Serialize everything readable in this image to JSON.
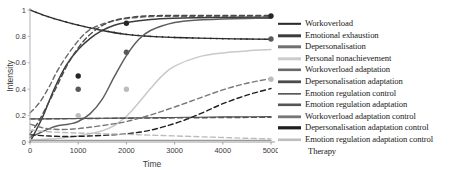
{
  "chart_data": {
    "type": "line",
    "title": "",
    "xlabel": "Time",
    "ylabel": "Intensity",
    "xlim": [
      0,
      5000
    ],
    "ylim": [
      0,
      1
    ],
    "xticks": [
      0,
      1000,
      2000,
      3000,
      4000,
      5000
    ],
    "xticklabels": [
      "0",
      "1000",
      "2000",
      "3000",
      "4000",
      "5000"
    ],
    "yticks": [
      0,
      0.2,
      0.4,
      0.6,
      0.8,
      1
    ],
    "yticklabels": [
      "0",
      "0.2",
      "0.4",
      "0.6",
      "0.8",
      "1"
    ],
    "grid": false,
    "legend_position": "right",
    "series": [
      {
        "name": "Workoverload",
        "color": "#2b2b2b",
        "style": "solid-marked",
        "x": [
          0,
          250,
          500,
          1000,
          1500,
          2000,
          2500,
          3000,
          3500,
          4000,
          4500,
          5000
        ],
        "y": [
          1.0,
          0.965,
          0.935,
          0.885,
          0.845,
          0.815,
          0.8,
          0.792,
          0.787,
          0.783,
          0.78,
          0.778
        ]
      },
      {
        "name": "Emotional exhaustion",
        "color": "#3c3c3c",
        "style": "solid",
        "x": [
          0,
          250,
          500,
          750,
          1000,
          1250,
          1500,
          1750,
          2000,
          2500,
          3000,
          3500,
          4000,
          4500,
          5000
        ],
        "y": [
          0.0,
          0.18,
          0.4,
          0.58,
          0.7,
          0.785,
          0.845,
          0.885,
          0.905,
          0.928,
          0.938,
          0.942,
          0.944,
          0.945,
          0.946
        ]
      },
      {
        "name": "Depersonalisation",
        "color": "#5e5e5e",
        "style": "solid",
        "x": [
          0,
          500,
          800,
          1000,
          1250,
          1500,
          1750,
          2000,
          2250,
          2500,
          3000,
          3500,
          4000,
          4500,
          5000
        ],
        "y": [
          0.035,
          0.115,
          0.135,
          0.155,
          0.215,
          0.325,
          0.495,
          0.655,
          0.775,
          0.845,
          0.905,
          0.925,
          0.932,
          0.936,
          0.938
        ]
      },
      {
        "name": "Personal nonachievement",
        "color": "#c9c9c9",
        "style": "solid",
        "x": [
          0,
          500,
          1000,
          1500,
          1750,
          2000,
          2250,
          2500,
          2750,
          3000,
          3500,
          4000,
          4500,
          5000
        ],
        "y": [
          0.015,
          0.025,
          0.045,
          0.085,
          0.125,
          0.195,
          0.295,
          0.405,
          0.505,
          0.575,
          0.645,
          0.675,
          0.69,
          0.7
        ]
      },
      {
        "name": "Workoverload adaptation",
        "color": "#6a6a6a",
        "style": "dashed",
        "x": [
          0,
          200,
          400,
          600,
          900,
          1200,
          1600,
          2000,
          2500,
          3000,
          3500,
          4000,
          4500,
          5000
        ],
        "y": [
          0.22,
          0.3,
          0.42,
          0.56,
          0.72,
          0.84,
          0.905,
          0.935,
          0.95,
          0.952,
          0.952,
          0.952,
          0.952,
          0.952
        ]
      },
      {
        "name": "Depersonalisation adaptation",
        "color": "#4a4a4a",
        "style": "dashed",
        "x": [
          0,
          200,
          500,
          800,
          1100,
          1400,
          1700,
          2000,
          2400,
          2800,
          3200,
          3600,
          4000,
          4500,
          5000
        ],
        "y": [
          0.06,
          0.17,
          0.38,
          0.6,
          0.76,
          0.86,
          0.915,
          0.94,
          0.955,
          0.958,
          0.958,
          0.958,
          0.958,
          0.958,
          0.958
        ]
      },
      {
        "name": "Emotion regulation control",
        "color": "#4f4f4f",
        "style": "solid-thin",
        "x": [
          0,
          500,
          1000,
          1500,
          2000,
          2500,
          3000,
          3500,
          4000,
          4500,
          5000
        ],
        "y": [
          0.175,
          0.176,
          0.178,
          0.18,
          0.182,
          0.184,
          0.186,
          0.188,
          0.19,
          0.191,
          0.192
        ]
      },
      {
        "name": "Emotion regulation adaptation",
        "color": "#555555",
        "style": "dashed",
        "x": [
          0,
          400,
          800,
          1200,
          1600,
          2000,
          2400,
          2800,
          3200,
          3600,
          4000,
          4400,
          5000
        ],
        "y": [
          0.175,
          0.176,
          0.177,
          0.178,
          0.179,
          0.18,
          0.181,
          0.182,
          0.183,
          0.184,
          0.185,
          0.186,
          0.187
        ]
      },
      {
        "name": "Workoverload adaptation control",
        "color": "#777777",
        "style": "dashed",
        "x": [
          0,
          300,
          600,
          900,
          1200,
          1600,
          2000,
          2500,
          3000,
          3500,
          4000,
          4500,
          5000
        ],
        "y": [
          0.135,
          0.105,
          0.095,
          0.098,
          0.11,
          0.13,
          0.155,
          0.205,
          0.265,
          0.33,
          0.395,
          0.445,
          0.48
        ]
      },
      {
        "name": "Depersonalisation adaptation control",
        "color": "#1f1f1f",
        "style": "dashed",
        "x": [
          0,
          400,
          800,
          1200,
          1600,
          2000,
          2400,
          2800,
          3200,
          3600,
          4000,
          4500,
          5000
        ],
        "y": [
          0.055,
          0.045,
          0.042,
          0.045,
          0.052,
          0.062,
          0.082,
          0.118,
          0.165,
          0.225,
          0.29,
          0.355,
          0.405
        ]
      },
      {
        "name": "Emotion regulation adaptation control",
        "color": "#bdbdbd",
        "style": "dashed",
        "x": [
          0,
          500,
          1000,
          1500,
          2000,
          2500,
          3000,
          3500,
          4000,
          4500,
          5000
        ],
        "y": [
          0.09,
          0.075,
          0.068,
          0.063,
          0.058,
          0.052,
          0.046,
          0.04,
          0.034,
          0.028,
          0.024
        ]
      },
      {
        "name": "Therapy",
        "color": "#9a9a9a",
        "style": "solid-flat",
        "x": [
          0,
          1000,
          2000,
          3000,
          4000,
          5000
        ],
        "y": [
          0.012,
          0.012,
          0.012,
          0.012,
          0.012,
          0.012
        ]
      }
    ],
    "markers": [
      {
        "series": "Emotional exhaustion",
        "color": "#262626",
        "points": [
          [
            1000,
            0.5
          ],
          [
            2000,
            0.9
          ],
          [
            5000,
            0.955
          ]
        ]
      },
      {
        "series": "Depersonalisation",
        "color": "#5a5a5a",
        "points": [
          [
            1000,
            0.4
          ],
          [
            2000,
            0.68
          ],
          [
            5000,
            0.78
          ]
        ]
      },
      {
        "series": "Personal nonachievement",
        "color": "#bcbcbc",
        "points": [
          [
            1000,
            0.2
          ],
          [
            2000,
            0.4
          ],
          [
            5000,
            0.475
          ]
        ]
      }
    ]
  },
  "legend": {
    "items": [
      {
        "label": "Workoverload",
        "style": "solid-marked",
        "color": "#2b2b2b",
        "width": 2.0
      },
      {
        "label": "Emotional exhaustion",
        "style": "solid",
        "color": "#3c3c3c",
        "width": 3.0
      },
      {
        "label": "Depersonalisation",
        "style": "solid",
        "color": "#707070",
        "width": 3.0
      },
      {
        "label": "Personal nonachievement",
        "style": "solid",
        "color": "#cccccc",
        "width": 3.0
      },
      {
        "label": "Workoverload adaptation",
        "style": "dashed",
        "color": "#6a6a6a",
        "width": 2.6
      },
      {
        "label": "Depersonalisation adaptation",
        "style": "dashed",
        "color": "#4a4a4a",
        "width": 2.8
      },
      {
        "label": "Emotion regulation control",
        "style": "solid-marked",
        "color": "#5a5a5a",
        "width": 1.6
      },
      {
        "label": "Emotion regulation adaptation",
        "style": "dashed",
        "color": "#555555",
        "width": 2.6
      },
      {
        "label": "Workoverload adaptation control",
        "style": "dashed",
        "color": "#777777",
        "width": 2.8
      },
      {
        "label": "Depersonalisation adaptation control",
        "style": "dashed",
        "color": "#1f1f1f",
        "width": 3.2
      },
      {
        "label": "Emotion regulation adaptation control",
        "style": "dashed",
        "color": "#bdbdbd",
        "width": 2.6
      },
      {
        "label": "Therapy",
        "style": "none",
        "color": "#9a9a9a",
        "width": 0
      }
    ]
  }
}
